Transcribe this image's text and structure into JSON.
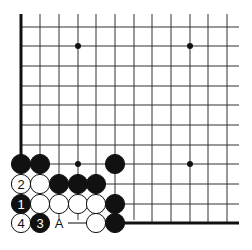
{
  "diagram": {
    "colors": {
      "background": "#ffffff",
      "grid": "#333333",
      "edge": "#111111",
      "black_stone": "#111111",
      "white_stone": "#ffffff"
    },
    "grid": {
      "columns_x": [
        21,
        40,
        59,
        78,
        96,
        115,
        134,
        152,
        171,
        190,
        208,
        227
      ],
      "rows_y": [
        27,
        46,
        66,
        86,
        105,
        125,
        145,
        164,
        184,
        204,
        223
      ],
      "top_y": 14,
      "right_x": 239
    },
    "star_points": [
      {
        "col": 3,
        "row": 1
      },
      {
        "col": 9,
        "row": 1
      },
      {
        "col": 3,
        "row": 7
      },
      {
        "col": 9,
        "row": 7
      }
    ],
    "stones": [
      {
        "col": 0,
        "row": 7,
        "color": "black",
        "label": ""
      },
      {
        "col": 1,
        "row": 7,
        "color": "black",
        "label": ""
      },
      {
        "col": 5,
        "row": 7,
        "color": "black",
        "label": ""
      },
      {
        "col": 0,
        "row": 8,
        "color": "white",
        "label": "2"
      },
      {
        "col": 1,
        "row": 8,
        "color": "white",
        "label": ""
      },
      {
        "col": 2,
        "row": 8,
        "color": "black",
        "label": ""
      },
      {
        "col": 3,
        "row": 8,
        "color": "black",
        "label": ""
      },
      {
        "col": 4,
        "row": 8,
        "color": "black",
        "label": ""
      },
      {
        "col": 0,
        "row": 9,
        "color": "black",
        "label": "1"
      },
      {
        "col": 1,
        "row": 9,
        "color": "white",
        "label": ""
      },
      {
        "col": 2,
        "row": 9,
        "color": "white",
        "label": ""
      },
      {
        "col": 3,
        "row": 9,
        "color": "white",
        "label": ""
      },
      {
        "col": 4,
        "row": 9,
        "color": "white",
        "label": ""
      },
      {
        "col": 5,
        "row": 9,
        "color": "black",
        "label": ""
      },
      {
        "col": 0,
        "row": 10,
        "color": "white",
        "label": "4"
      },
      {
        "col": 1,
        "row": 10,
        "color": "black",
        "label": "3"
      },
      {
        "col": 4,
        "row": 10,
        "color": "white",
        "label": ""
      },
      {
        "col": 5,
        "row": 10,
        "color": "black",
        "label": ""
      }
    ],
    "markers": [
      {
        "col": 2,
        "row": 10,
        "text": "A"
      }
    ]
  }
}
